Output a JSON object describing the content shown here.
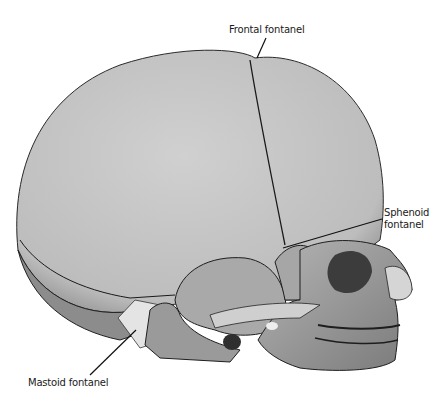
{
  "figure": {
    "style": "grayscale anatomical illustration",
    "colors": {
      "background": "#ffffff",
      "bone_light": "#c9c9c9",
      "bone_mid": "#a8a8a8",
      "bone_dark": "#6e6e6e",
      "suture_line": "#1e1e1e",
      "fontanel_membrane": "#e6e6e6"
    }
  },
  "labels": {
    "frontal": "Frontal fontanel",
    "sphenoid_line1": "Sphenoid",
    "sphenoid_line2": "fontanel",
    "mastoid": "Mastoid fontanel"
  }
}
